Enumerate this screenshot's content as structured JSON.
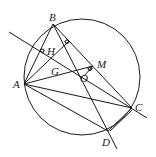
{
  "diagram": {
    "type": "geometry",
    "circle": {
      "center": [
        82,
        77
      ],
      "r": 58
    },
    "points": {
      "A": {
        "label": "A",
        "xy": [
          24,
          84
        ],
        "lx": 13,
        "ly": 88
      },
      "B": {
        "label": "B",
        "xy": [
          53,
          24
        ],
        "lx": 49,
        "ly": 21
      },
      "C": {
        "label": "C",
        "xy": [
          132,
          108
        ],
        "lx": 135,
        "ly": 111
      },
      "D": {
        "label": "D",
        "xy": [
          108,
          131
        ],
        "lx": 102,
        "ly": 145
      },
      "M": {
        "label": "M",
        "xy": [
          93,
          66
        ],
        "lx": 97,
        "ly": 68
      },
      "O": {
        "label": "O",
        "xy": [
          82,
          77
        ],
        "lx": 80,
        "ly": 82
      },
      "G": {
        "label": "G",
        "xy": [
          59,
          73
        ],
        "lx": 51,
        "ly": 75
      },
      "H": {
        "label": "H",
        "xy": [
          50,
          48
        ],
        "lx": 47,
        "ly": 55
      }
    },
    "segments": [
      [
        "A",
        "B"
      ],
      [
        "A",
        "C"
      ],
      [
        "A",
        "D"
      ],
      [
        "A",
        "M"
      ],
      [
        "B",
        "C"
      ],
      [
        "C",
        "D"
      ]
    ]
  }
}
